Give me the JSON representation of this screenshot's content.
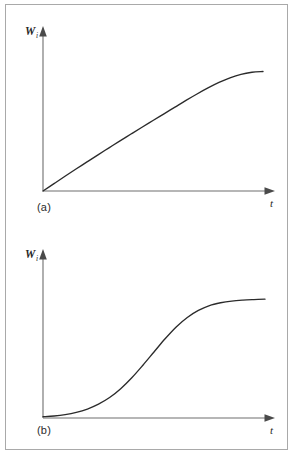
{
  "figure": {
    "background_color": "#ffffff",
    "frame_color": "#a9a9a9",
    "axis_color": "#6e6e6e",
    "curve_color": "#2b2b2b",
    "panels": [
      {
        "caption": "(a)",
        "y_axis_label": "W",
        "y_axis_label_subscript": "i",
        "x_axis_label": "t"
      },
      {
        "caption": "(b)",
        "y_axis_label": "W",
        "y_axis_label_subscript": "i",
        "x_axis_label": "t"
      }
    ]
  },
  "chart_data": [
    {
      "type": "line",
      "title": "(a)",
      "xlabel": "t",
      "ylabel": "Wi",
      "grid": false,
      "legend": null,
      "xlim": [
        0,
        1
      ],
      "ylim": [
        0,
        1
      ],
      "x_tick_labels": [],
      "y_tick_labels": [],
      "description": "Concave-down saturating growth curve: starts at the origin with a steep, nearly linear rise, then bends over and flattens to a horizontal asymptote.",
      "series": [
        {
          "name": "saturating-growth",
          "x": [
            0.0,
            0.05,
            0.1,
            0.15,
            0.2,
            0.25,
            0.3,
            0.35,
            0.4,
            0.45,
            0.5,
            0.55,
            0.6,
            0.65,
            0.7,
            0.75,
            0.8,
            0.85,
            0.9,
            0.95,
            1.0
          ],
          "y": [
            0.0,
            0.055,
            0.11,
            0.164,
            0.217,
            0.27,
            0.322,
            0.374,
            0.425,
            0.476,
            0.526,
            0.576,
            0.626,
            0.676,
            0.724,
            0.769,
            0.81,
            0.845,
            0.871,
            0.886,
            0.892
          ]
        }
      ]
    },
    {
      "type": "line",
      "title": "(b)",
      "xlabel": "t",
      "ylabel": "Wi",
      "grid": false,
      "legend": null,
      "xlim": [
        0,
        1
      ],
      "ylim": [
        0,
        1
      ],
      "x_tick_labels": [],
      "y_tick_labels": [],
      "description": "Sigmoid (S-shaped) logistic growth curve: nearly flat at the origin, accelerating through an inflection point near the middle, then decelerating to a horizontal asymptote.",
      "series": [
        {
          "name": "sigmoid-growth",
          "x": [
            0.0,
            0.05,
            0.1,
            0.15,
            0.2,
            0.25,
            0.3,
            0.35,
            0.4,
            0.45,
            0.5,
            0.55,
            0.6,
            0.65,
            0.7,
            0.75,
            0.8,
            0.85,
            0.9,
            0.95,
            1.0
          ],
          "y": [
            0.01,
            0.015,
            0.025,
            0.042,
            0.068,
            0.105,
            0.155,
            0.222,
            0.305,
            0.4,
            0.5,
            0.6,
            0.69,
            0.762,
            0.815,
            0.852,
            0.873,
            0.886,
            0.893,
            0.897,
            0.9
          ]
        }
      ]
    }
  ]
}
